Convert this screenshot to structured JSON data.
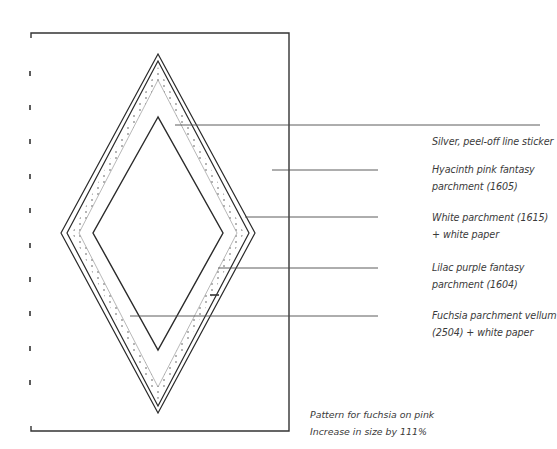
{
  "diagram": {
    "colors": {
      "line": "#2a2a2a",
      "leader": "#4a4a4a",
      "dots": "#555555",
      "background": "#ffffff"
    },
    "labels": [
      {
        "id": "silver",
        "line1": "Silver, peel-off line sticker",
        "line2": ""
      },
      {
        "id": "hyacinth",
        "line1": "Hyacinth pink fantasy",
        "line2": "parchment (1605)"
      },
      {
        "id": "white",
        "line1": "White parchment (1615)",
        "line2": "+ white paper"
      },
      {
        "id": "lilac",
        "line1": "Lilac purple fantasy",
        "line2": "parchment (1604)"
      },
      {
        "id": "fuchsia",
        "line1": "Fuchsia parchment vellum",
        "line2": "(2504) + white paper"
      }
    ],
    "caption": {
      "line1": "Pattern for fuchsia on pink",
      "line2": "Increase in size by 111%"
    }
  }
}
